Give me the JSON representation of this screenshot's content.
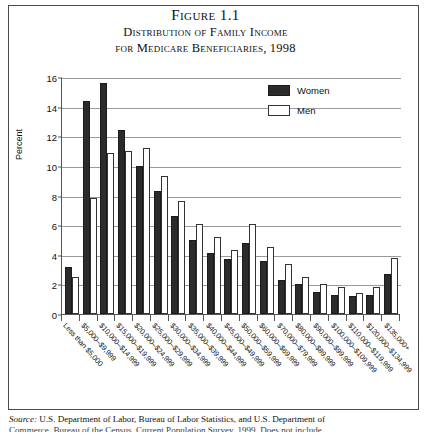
{
  "figure": {
    "number": "Figure 1.1",
    "title_line1": "Distribution of Family Income",
    "title_line2": "for Medicare Beneficiaries, 1998"
  },
  "legend": {
    "position": "top-right",
    "entries": [
      {
        "label": "Women",
        "color": "#2b2b2b",
        "style": "filled"
      },
      {
        "label": "Men",
        "color": "#ffffff",
        "style": "outline"
      }
    ]
  },
  "source": {
    "label": "Source:",
    "line1": "U.S. Department of Labor, Bureau of Labor Statistics, and U.S. Department of",
    "line2": "Commerce, Bureau of the Census, Current Population Survey, 1999. Does not include"
  },
  "axis": {
    "y_label": "Percent",
    "y_ticks": [
      "0",
      "2",
      "4",
      "6",
      "8",
      "10",
      "12",
      "14",
      "16"
    ]
  },
  "chart_data": {
    "type": "bar",
    "title": "Distribution of Family Income for Medicare Beneficiaries, 1998",
    "xlabel": "",
    "ylabel": "Percent",
    "ylim": [
      0,
      16
    ],
    "grid": true,
    "legend_position": "upper right",
    "categories": [
      "Less than $5,000",
      "$5,000–$9,999",
      "$10,000–$14,999",
      "$15,000–$19,999",
      "$20,000–$24,999",
      "$25,000–$29,999",
      "$30,000–$34,999",
      "$35,000–$39,999",
      "$40,000–$44,999",
      "$45,000–$49,999",
      "$50,000–$59,999",
      "$60,000–$69,999",
      "$70,000–$79,999",
      "$80,000–$89,999",
      "$90,000–$99,999",
      "$100,000–$109,999",
      "$110,000–$119,999",
      "$120,000–$134,999",
      "$135,000+"
    ],
    "series": [
      {
        "name": "Women",
        "color": "#2b2b2b",
        "values": [
          3.2,
          14.4,
          15.6,
          12.4,
          10.0,
          8.3,
          6.6,
          5.0,
          4.1,
          3.7,
          4.8,
          3.6,
          2.3,
          2.0,
          1.5,
          1.3,
          1.2,
          1.3,
          2.7
        ]
      },
      {
        "name": "Men",
        "color": "#ffffff",
        "values": [
          2.5,
          7.8,
          10.9,
          11.0,
          11.2,
          9.3,
          7.6,
          6.1,
          5.2,
          4.3,
          6.1,
          4.5,
          3.4,
          2.5,
          2.0,
          1.8,
          1.4,
          1.8,
          3.8
        ]
      }
    ]
  }
}
